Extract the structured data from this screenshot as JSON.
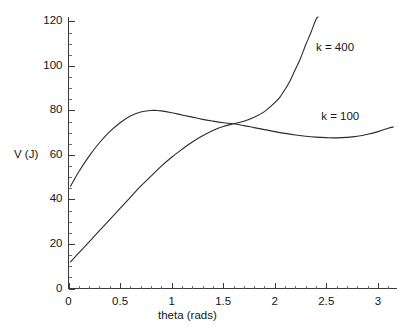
{
  "chart_data": {
    "type": "line",
    "title": "",
    "xlabel": "theta (rads)",
    "ylabel": "V (J)",
    "xlim": [
      0,
      3.18
    ],
    "ylim": [
      0,
      122
    ],
    "grid": false,
    "legend_position": "inline-annotation",
    "xticks": [
      "0",
      "0.5",
      "1",
      "1.5",
      "2",
      "2.5",
      "3"
    ],
    "xtick_values": [
      0,
      0.5,
      1,
      1.5,
      2,
      2.5,
      3
    ],
    "yticks": [
      "0",
      "20",
      "40",
      "60",
      "80",
      "100",
      "120"
    ],
    "ytick_values": [
      0,
      20,
      40,
      60,
      80,
      100,
      120
    ],
    "x_minor_step": 0.1,
    "y_minor_step": 5,
    "series": [
      {
        "name": "k = 100",
        "label": "k = 100",
        "color": "#2b2b2b",
        "x": [
          0.02,
          0.1,
          0.2,
          0.3,
          0.4,
          0.5,
          0.6,
          0.7,
          0.8,
          0.85,
          0.9,
          1.0,
          1.1,
          1.2,
          1.3,
          1.4,
          1.5,
          1.6,
          1.7,
          1.8,
          1.9,
          2.0,
          2.1,
          2.2,
          2.3,
          2.4,
          2.5,
          2.6,
          2.7,
          2.8,
          2.9,
          3.0,
          3.1,
          3.15
        ],
        "y": [
          46.0,
          52.5,
          59.5,
          65.5,
          70.5,
          74.5,
          77.5,
          79.3,
          80.0,
          80.0,
          79.8,
          79.0,
          78.0,
          77.0,
          76.0,
          75.2,
          74.5,
          74.0,
          73.2,
          72.3,
          71.4,
          70.5,
          69.7,
          69.0,
          68.4,
          68.0,
          67.8,
          67.7,
          67.9,
          68.4,
          69.3,
          70.5,
          72.0,
          72.6
        ]
      },
      {
        "name": "k = 400",
        "label": "k = 400",
        "color": "#2b2b2b",
        "x": [
          0.02,
          0.1,
          0.2,
          0.3,
          0.4,
          0.5,
          0.6,
          0.7,
          0.8,
          0.9,
          1.0,
          1.1,
          1.2,
          1.3,
          1.4,
          1.5,
          1.6,
          1.7,
          1.8,
          1.9,
          2.0,
          2.05,
          2.1,
          2.15,
          2.2,
          2.25,
          2.3,
          2.35,
          2.4,
          2.42
        ],
        "y": [
          12.0,
          16.0,
          21.0,
          26.0,
          31.0,
          36.0,
          41.0,
          46.0,
          50.5,
          55.0,
          59.0,
          62.5,
          65.8,
          68.6,
          71.0,
          72.8,
          74.0,
          75.2,
          77.0,
          79.5,
          83.5,
          86.0,
          89.5,
          93.5,
          98.5,
          103.5,
          109.5,
          115.0,
          121.0,
          122.0
        ]
      }
    ],
    "annotations": [
      {
        "text": "k = 400",
        "x": 2.4,
        "y": 108
      },
      {
        "text": "k = 100",
        "x": 2.45,
        "y": 77
      }
    ]
  }
}
